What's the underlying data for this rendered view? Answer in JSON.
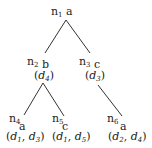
{
  "diagram": {
    "type": "tree",
    "edge_color": "#333333",
    "nodes": [
      {
        "id": "n1",
        "name": "n",
        "sub": "1",
        "term": "a",
        "docs": []
      },
      {
        "id": "n2",
        "name": "n",
        "sub": "2",
        "term": "b",
        "docs": [
          {
            "d": "d",
            "s": "4"
          }
        ]
      },
      {
        "id": "n3",
        "name": "n",
        "sub": "3",
        "term": "c",
        "docs": [
          {
            "d": "d",
            "s": "3"
          }
        ]
      },
      {
        "id": "n4",
        "name": "n",
        "sub": "4",
        "term": "a",
        "docs": [
          {
            "d": "d",
            "s": "1"
          },
          {
            "d": "d",
            "s": "3"
          }
        ]
      },
      {
        "id": "n5",
        "name": "n",
        "sub": "5",
        "term": "c",
        "docs": [
          {
            "d": "d",
            "s": "1"
          },
          {
            "d": "d",
            "s": "5"
          }
        ]
      },
      {
        "id": "n6",
        "name": "n",
        "sub": "6",
        "term": "a",
        "docs": [
          {
            "d": "d",
            "s": "2"
          },
          {
            "d": "d",
            "s": "4"
          }
        ]
      }
    ],
    "edges": [
      [
        "n1",
        "n2"
      ],
      [
        "n1",
        "n3"
      ],
      [
        "n2",
        "n4"
      ],
      [
        "n2",
        "n5"
      ],
      [
        "n3",
        "n6"
      ]
    ]
  }
}
